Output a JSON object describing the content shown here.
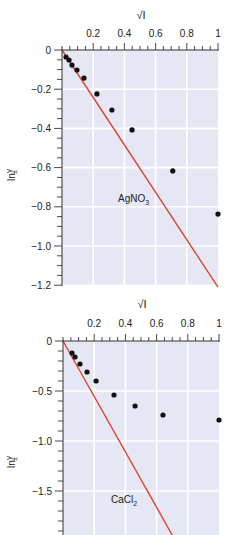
{
  "chart_data": [
    {
      "type": "scatter",
      "title": "",
      "xlabel": "√I",
      "ylabel": "ln γ±",
      "annotation": "AgNO3",
      "xlim": [
        0,
        1
      ],
      "ylim": [
        -1.2,
        0
      ],
      "xticks": [
        0.2,
        0.4,
        0.6,
        0.8,
        1
      ],
      "xtick_labels": [
        "0.2",
        "0.4",
        "0.6",
        "0.8",
        "1"
      ],
      "yticks": [
        0,
        -0.2,
        -0.4,
        -0.6,
        -0.8,
        -1.0,
        -1.2
      ],
      "ytick_labels": [
        "0",
        "−0.2",
        "−0.4",
        "−0.6",
        "−0.8",
        "−1.0",
        "−1.2"
      ],
      "x_axis_position": "top",
      "grid": true,
      "series": [
        {
          "name": "experimental",
          "type": "scatter",
          "color": "#111111",
          "x": [
            0.026,
            0.045,
            0.064,
            0.096,
            0.141,
            0.224,
            0.32,
            0.449,
            0.71,
            1.0
          ],
          "y": [
            -0.036,
            -0.051,
            -0.077,
            -0.102,
            -0.143,
            -0.224,
            -0.306,
            -0.408,
            -0.617,
            -0.837
          ]
        },
        {
          "name": "Debye–Hückel limiting law",
          "type": "line",
          "color": "#d9462a",
          "x": [
            0,
            1.0
          ],
          "y": [
            0,
            -1.21
          ]
        }
      ]
    },
    {
      "type": "scatter",
      "title": "",
      "xlabel": "√I",
      "ylabel": "ln γ±",
      "annotation": "CaCl2",
      "xlim": [
        0,
        1
      ],
      "ylim": [
        -1.94,
        0
      ],
      "xticks": [
        0.2,
        0.4,
        0.6,
        0.8,
        1
      ],
      "xtick_labels": [
        "0.2",
        "0.4",
        "0.6",
        "0.8",
        "1"
      ],
      "yticks": [
        0,
        -0.5,
        -1.0,
        -1.5
      ],
      "ytick_labels": [
        "0",
        "−0.5",
        "−1.0",
        "−1.5"
      ],
      "x_axis_position": "top",
      "grid": true,
      "series": [
        {
          "name": "experimental",
          "type": "scatter",
          "color": "#111111",
          "x": [
            0.058,
            0.077,
            0.109,
            0.154,
            0.212,
            0.327,
            0.462,
            0.641,
            1.0
          ],
          "y": [
            -0.12,
            -0.16,
            -0.23,
            -0.31,
            -0.4,
            -0.54,
            -0.65,
            -0.74,
            -0.79
          ]
        },
        {
          "name": "Debye–Hückel limiting law",
          "type": "line",
          "color": "#d9462a",
          "x": [
            0,
            0.7
          ],
          "y": [
            0,
            -1.94
          ]
        }
      ]
    }
  ],
  "colors": {
    "plot_bg": "#e6e7f4",
    "grid": "#ffffff",
    "axis": "#333333",
    "line": "#d9462a",
    "points": "#111111"
  },
  "labels": {
    "top_xlabel": "√I",
    "bottom_xlabel": "√I",
    "ylabel_main": "ln",
    "ylabel_sym": "γ",
    "ylabel_sub": "±",
    "top_annotation": "AgNO",
    "top_annotation_sub": "3",
    "bottom_annotation": "CaCl",
    "bottom_annotation_sub": "2"
  }
}
